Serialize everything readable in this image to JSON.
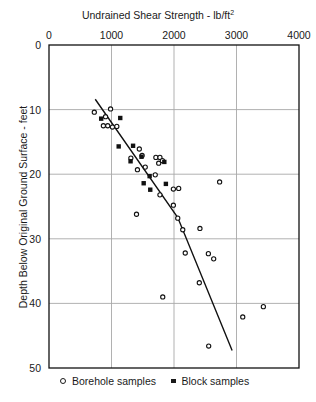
{
  "colors": {
    "background": "#ffffff",
    "frame": "#111111",
    "grid": "#a8a8a8",
    "marker": "#111111",
    "text": "#1a1a1a"
  },
  "chart_data": {
    "type": "scatter",
    "title_main": "Undrained Shear Strength - lb/ft",
    "title_superscript": "2",
    "xlabel": "Undrained Shear Strength - lb/ft²",
    "ylabel": "Depth Below Original Ground Surface - feet",
    "x_axis": {
      "position": "top",
      "range": [
        0,
        4000
      ],
      "ticks": [
        0,
        1000,
        2000,
        3000,
        4000
      ]
    },
    "y_axis": {
      "position": "left",
      "range": [
        0,
        50
      ],
      "ticks": [
        0,
        10,
        20,
        30,
        40,
        50
      ],
      "inverted": true
    },
    "grid": true,
    "series": [
      {
        "name": "Borehole samples",
        "marker": "circle",
        "points": [
          [
            725,
            10.4
          ],
          [
            985,
            9.9
          ],
          [
            905,
            11.1
          ],
          [
            870,
            12.5
          ],
          [
            940,
            12.5
          ],
          [
            1015,
            12.7
          ],
          [
            1085,
            12.6
          ],
          [
            1445,
            16.1
          ],
          [
            1310,
            17.5
          ],
          [
            1490,
            17.1
          ],
          [
            1540,
            18.9
          ],
          [
            1415,
            19.3
          ],
          [
            1710,
            17.4
          ],
          [
            1775,
            17.4
          ],
          [
            1815,
            17.9
          ],
          [
            1755,
            18.3
          ],
          [
            1700,
            20.1
          ],
          [
            1990,
            22.3
          ],
          [
            2075,
            22.2
          ],
          [
            1775,
            23.2
          ],
          [
            1990,
            24.8
          ],
          [
            2730,
            21.2
          ],
          [
            1400,
            26.2
          ],
          [
            2060,
            26.8
          ],
          [
            2140,
            28.6
          ],
          [
            2415,
            28.4
          ],
          [
            2180,
            32.2
          ],
          [
            2550,
            32.3
          ],
          [
            2635,
            33.1
          ],
          [
            2405,
            36.8
          ],
          [
            1820,
            39.0
          ],
          [
            3430,
            40.5
          ],
          [
            3100,
            42.1
          ],
          [
            2555,
            46.6
          ]
        ]
      },
      {
        "name": "Block samples",
        "marker": "square",
        "points": [
          [
            835,
            11.4
          ],
          [
            1140,
            11.3
          ],
          [
            1115,
            15.7
          ],
          [
            1345,
            15.6
          ],
          [
            1305,
            18.0
          ],
          [
            1480,
            17.3
          ],
          [
            1845,
            18.1
          ],
          [
            1610,
            20.3
          ],
          [
            1515,
            21.4
          ],
          [
            1620,
            22.4
          ],
          [
            1870,
            21.5
          ]
        ]
      }
    ],
    "trend_line": {
      "vertices": [
        [
          740,
          8.4
        ],
        [
          2060,
          26.7
        ],
        [
          2930,
          47.3
        ]
      ]
    },
    "legend": {
      "position": "bottom",
      "items": [
        "Borehole samples",
        "Block samples"
      ]
    }
  }
}
